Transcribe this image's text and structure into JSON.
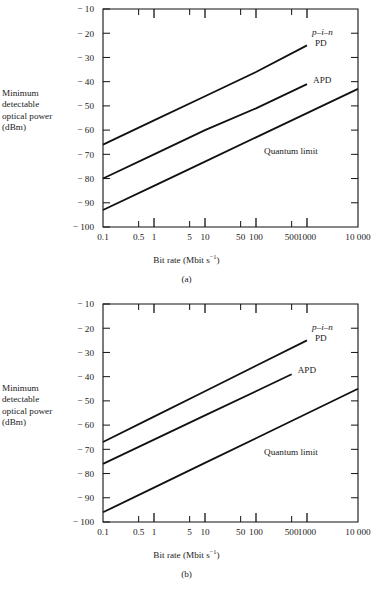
{
  "figure": {
    "axis_title_y_lines": [
      "Minimum",
      "detectable",
      "optical power",
      "(dBm)"
    ],
    "axis_title_x": "Bit rate (Mbit s",
    "axis_title_x_sup": "−1",
    "axis_title_x_end": ")",
    "y_ticks": [
      "− 10",
      "− 20",
      "− 30",
      "− 40",
      "− 50",
      "− 60",
      "− 70",
      "− 80",
      "− 90",
      "− 100"
    ],
    "x_ticks": [
      "0.1",
      "0.5",
      "1",
      "5",
      "10",
      "50",
      "100",
      "500",
      "1000",
      "10 000"
    ],
    "curve_labels": {
      "pin_italic": "p–i–n",
      "pin_roman": "PD",
      "apd": "APD",
      "quantum": "Quantum limit"
    },
    "panel_a_caption": "(a)",
    "panel_b_caption": "(b)",
    "colors": {
      "ink": "#1a1a1a",
      "axis": "#111111",
      "background": "#ffffff"
    }
  },
  "chart_data": [
    {
      "type": "line",
      "panel": "(a)",
      "title": "",
      "xlabel": "Bit rate (Mbit s⁻¹)",
      "ylabel": "Minimum detectable optical power (dBm)",
      "xscale": "log",
      "xlim": [
        0.1,
        10000
      ],
      "ylim": [
        -100,
        -10
      ],
      "grid": false,
      "legend": "inline-annotations",
      "xticks": [
        0.1,
        0.5,
        1,
        5,
        10,
        50,
        100,
        500,
        1000,
        10000
      ],
      "xticklabels": [
        "0.1",
        "0.5",
        "1",
        "5",
        "10",
        "50",
        "100",
        "500",
        "1000",
        "10 000"
      ],
      "yticks": [
        -10,
        -20,
        -30,
        -40,
        -50,
        -60,
        -70,
        -80,
        -90,
        -100
      ],
      "yticklabels": [
        "− 10",
        "− 20",
        "− 30",
        "− 40",
        "− 50",
        "− 60",
        "− 70",
        "− 80",
        "− 90",
        "− 100"
      ],
      "series": [
        {
          "name": "p–i–n PD",
          "label": "p–i–n PD",
          "x": [
            0.1,
            1000
          ],
          "y": [
            -66,
            -25
          ],
          "points": [
            [
              0.1,
              -66
            ],
            [
              1,
              -56
            ],
            [
              10,
              -46
            ],
            [
              100,
              -36
            ],
            [
              1000,
              -25
            ]
          ],
          "slope_db_per_decade": 10.25
        },
        {
          "name": "APD",
          "label": "APD",
          "x": [
            0.1,
            1000
          ],
          "y": [
            -80,
            -41
          ],
          "points": [
            [
              0.1,
              -80
            ],
            [
              1,
              -70
            ],
            [
              10,
              -60
            ],
            [
              100,
              -51
            ],
            [
              1000,
              -41
            ]
          ],
          "slope_db_per_decade": 9.75
        },
        {
          "name": "Quantum limit",
          "label": "Quantum limit",
          "x": [
            0.1,
            10000
          ],
          "y": [
            -93,
            -43
          ],
          "points": [
            [
              0.1,
              -93
            ],
            [
              1,
              -83
            ],
            [
              10,
              -73
            ],
            [
              100,
              -63
            ],
            [
              1000,
              -53
            ],
            [
              10000,
              -43
            ]
          ],
          "slope_db_per_decade": 10.0
        }
      ]
    },
    {
      "type": "line",
      "panel": "(b)",
      "title": "",
      "xlabel": "Bit rate (Mbit s⁻¹)",
      "ylabel": "Minimum detectable optical power (dBm)",
      "xscale": "log",
      "xlim": [
        0.1,
        10000
      ],
      "ylim": [
        -100,
        -10
      ],
      "grid": false,
      "legend": "inline-annotations",
      "xticks": [
        0.1,
        0.5,
        1,
        5,
        10,
        50,
        100,
        500,
        1000,
        10000
      ],
      "xticklabels": [
        "0.1",
        "0.5",
        "1",
        "5",
        "10",
        "50",
        "100",
        "500",
        "1000",
        "10 000"
      ],
      "yticks": [
        -10,
        -20,
        -30,
        -40,
        -50,
        -60,
        -70,
        -80,
        -90,
        -100
      ],
      "yticklabels": [
        "− 10",
        "− 20",
        "− 30",
        "− 40",
        "− 50",
        "− 60",
        "− 70",
        "− 80",
        "− 90",
        "− 100"
      ],
      "series": [
        {
          "name": "p–i–n PD",
          "label": "p–i–n PD",
          "x": [
            0.1,
            1000
          ],
          "y": [
            -67,
            -25
          ],
          "points": [
            [
              0.1,
              -67
            ],
            [
              1,
              -56.5
            ],
            [
              10,
              -46
            ],
            [
              100,
              -35.5
            ],
            [
              1000,
              -25
            ]
          ],
          "slope_db_per_decade": 10.5
        },
        {
          "name": "APD",
          "label": "APD",
          "x": [
            0.1,
            500
          ],
          "y": [
            -76,
            -39
          ],
          "points": [
            [
              0.1,
              -76
            ],
            [
              1,
              -66
            ],
            [
              10,
              -56
            ],
            [
              100,
              -46
            ],
            [
              500,
              -39
            ]
          ],
          "slope_db_per_decade": 10.0
        },
        {
          "name": "Quantum limit",
          "label": "Quantum limit",
          "x": [
            0.1,
            10000
          ],
          "y": [
            -96,
            -45
          ],
          "points": [
            [
              0.1,
              -96
            ],
            [
              1,
              -85.8
            ],
            [
              10,
              -75.6
            ],
            [
              100,
              -65.4
            ],
            [
              1000,
              -55.2
            ],
            [
              10000,
              -45
            ]
          ],
          "slope_db_per_decade": 10.2
        }
      ]
    }
  ]
}
